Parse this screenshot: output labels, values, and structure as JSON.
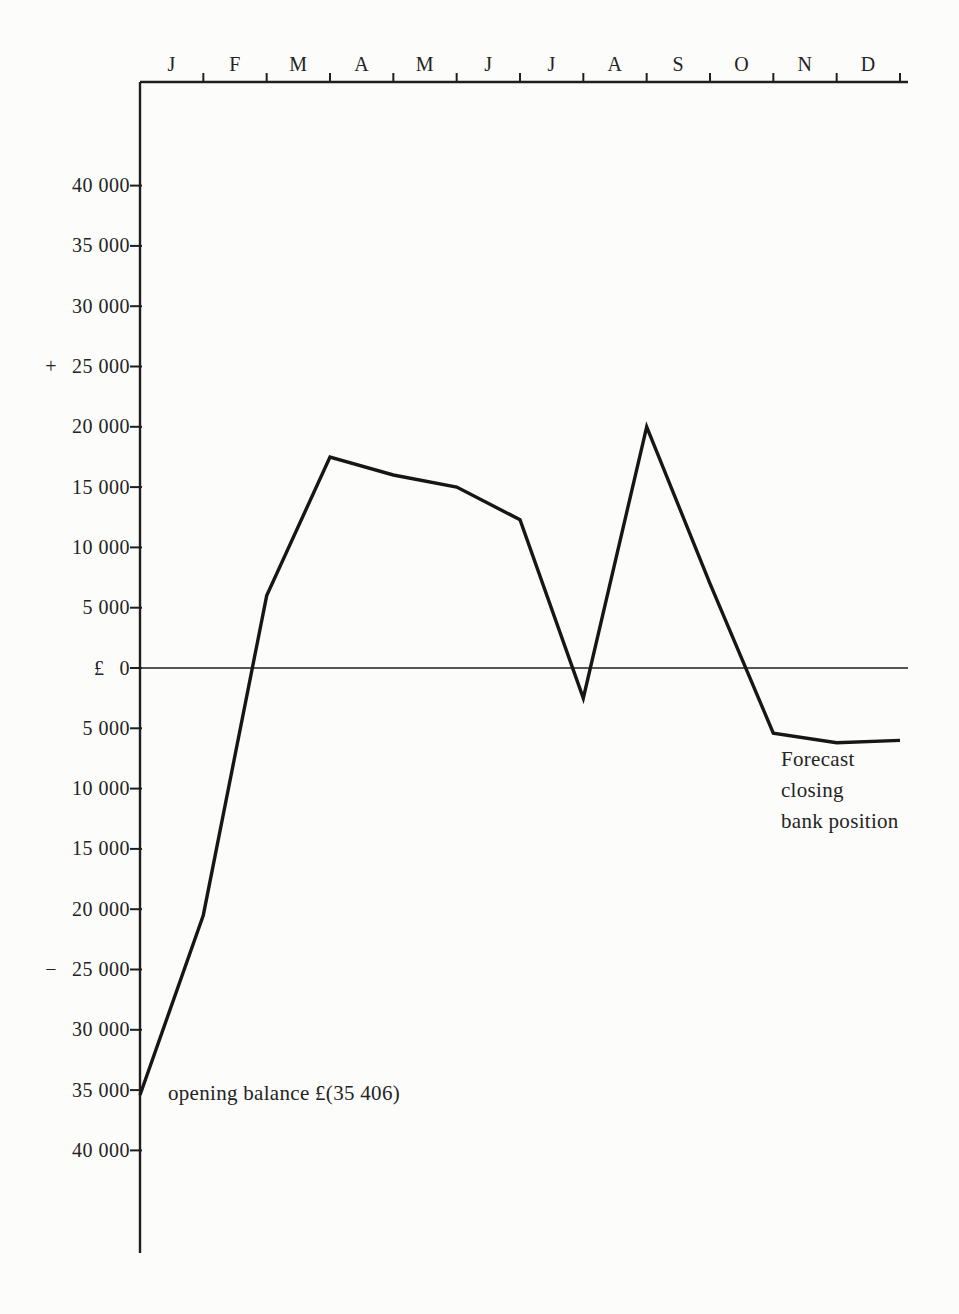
{
  "page": {
    "background_color": "#fcfcfa",
    "ink_color": "#1f1f1f"
  },
  "chart_data": {
    "type": "line",
    "title": "",
    "x_axis": {
      "position": "top",
      "month_labels": [
        "J",
        "F",
        "M",
        "A",
        "M",
        "J",
        "J",
        "A",
        "S",
        "O",
        "N",
        "D"
      ]
    },
    "y_axis": {
      "currency_symbol": "£",
      "positive_sign": "+",
      "negative_sign": "−",
      "step": 5000,
      "range": [
        -40000,
        40000
      ],
      "ticks": [
        {
          "value": 40000,
          "label": "40 000",
          "prefix": "",
          "prefix_name": ""
        },
        {
          "value": 35000,
          "label": "35 000",
          "prefix": "",
          "prefix_name": ""
        },
        {
          "value": 30000,
          "label": "30 000",
          "prefix": "",
          "prefix_name": ""
        },
        {
          "value": 25000,
          "label": "25 000",
          "prefix": "+",
          "prefix_name": "plus-sign"
        },
        {
          "value": 20000,
          "label": "20 000",
          "prefix": "",
          "prefix_name": ""
        },
        {
          "value": 15000,
          "label": "15 000",
          "prefix": "",
          "prefix_name": ""
        },
        {
          "value": 10000,
          "label": "10 000",
          "prefix": "",
          "prefix_name": ""
        },
        {
          "value": 5000,
          "label": "5 000",
          "prefix": "",
          "prefix_name": ""
        },
        {
          "value": 0,
          "label": "0",
          "prefix": "£",
          "prefix_name": "pound-sign"
        },
        {
          "value": -5000,
          "label": "5 000",
          "prefix": "",
          "prefix_name": ""
        },
        {
          "value": -10000,
          "label": "10 000",
          "prefix": "",
          "prefix_name": ""
        },
        {
          "value": -15000,
          "label": "15 000",
          "prefix": "",
          "prefix_name": ""
        },
        {
          "value": -20000,
          "label": "20 000",
          "prefix": "",
          "prefix_name": ""
        },
        {
          "value": -25000,
          "label": "25 000",
          "prefix": "−",
          "prefix_name": "minus-sign"
        },
        {
          "value": -30000,
          "label": "30 000",
          "prefix": "",
          "prefix_name": ""
        },
        {
          "value": -35000,
          "label": "35 000",
          "prefix": "",
          "prefix_name": ""
        },
        {
          "value": -40000,
          "label": "40 000",
          "prefix": "",
          "prefix_name": ""
        }
      ]
    },
    "series": [
      {
        "name": "Forecast closing bank position",
        "opening_balance": -35406,
        "month_end_values": [
          -20500,
          6000,
          17500,
          16000,
          15000,
          12300,
          -2500,
          20000,
          7000,
          -5400,
          -6200,
          -6000
        ]
      }
    ],
    "grid": false,
    "legend": "none",
    "annotations": {
      "opening_balance_label": "opening balance £(35 406)",
      "forecast_closing_label": "Forecast\ncloseing-placeholder"
    }
  }
}
